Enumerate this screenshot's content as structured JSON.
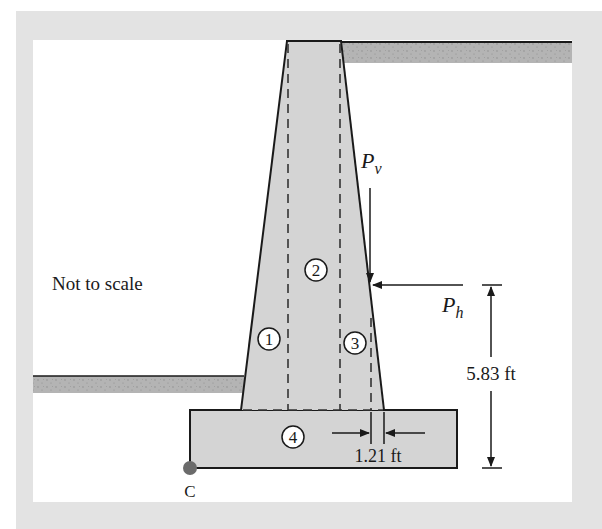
{
  "figure": {
    "note": "Not to scale",
    "forces": {
      "vertical": {
        "symbol": "P",
        "subscript": "v"
      },
      "horizontal": {
        "symbol": "P",
        "subscript": "h"
      }
    },
    "dimensions": {
      "height": "5.83 ft",
      "offset": "1.21 ft"
    },
    "regions": [
      "1",
      "2",
      "3",
      "4"
    ],
    "point": "C"
  },
  "colors": {
    "frame": "#e3e3e3",
    "concrete": "#d4d4d4",
    "soil": "#b4b4b4",
    "line": "#1a1a1a",
    "point": "#6b6b6b"
  }
}
